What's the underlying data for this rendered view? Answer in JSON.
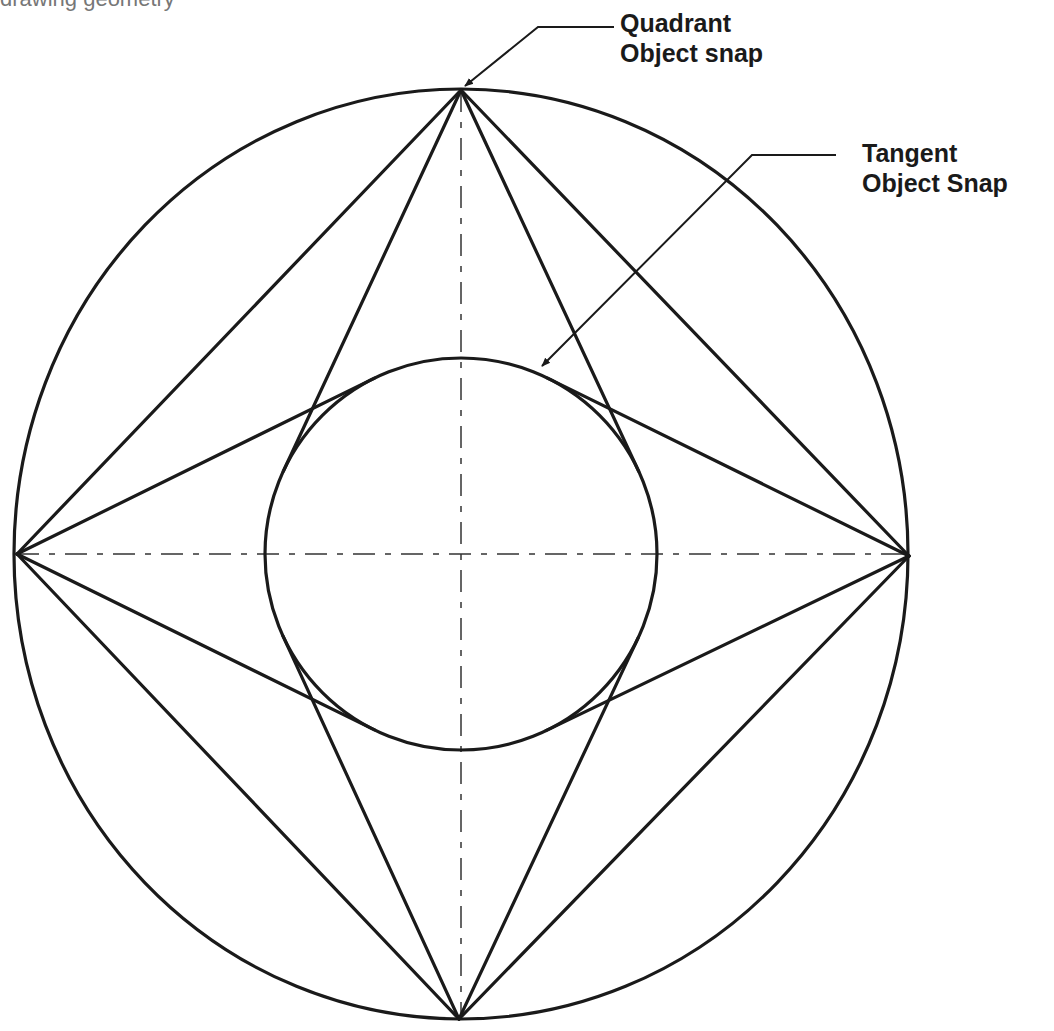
{
  "caption": {
    "text": "drawing geometry",
    "note": "partially cropped at top edge"
  },
  "labels": {
    "quadrant": {
      "line1": "Quadrant",
      "line2": "Object snap",
      "x": 620,
      "y": 8
    },
    "tangent": {
      "line1": "Tangent",
      "line2": "Object Snap",
      "x": 862,
      "y": 138
    }
  },
  "geometry": {
    "stroke_color": "#1a1a1a",
    "center": [
      461,
      554
    ],
    "outer_circle": {
      "rx": 447,
      "ry": 465
    },
    "inner_circle": {
      "r": 196
    },
    "quadrant_points": {
      "top": [
        461,
        90
      ],
      "right": [
        909,
        556
      ],
      "bottom": [
        459,
        1019
      ],
      "left": [
        17,
        554
      ]
    },
    "center_lines": {
      "horizontal": [
        17,
        554,
        909,
        554
      ],
      "vertical": [
        461,
        90,
        461,
        1019
      ],
      "dash": "22 10 6 10"
    },
    "leaders": {
      "quadrant": {
        "points": [
          [
            614,
            27
          ],
          [
            538,
            27
          ],
          [
            465,
            86
          ]
        ]
      },
      "tangent": {
        "points": [
          [
            836,
            155
          ],
          [
            752,
            155
          ],
          [
            542,
            366
          ]
        ]
      }
    }
  }
}
